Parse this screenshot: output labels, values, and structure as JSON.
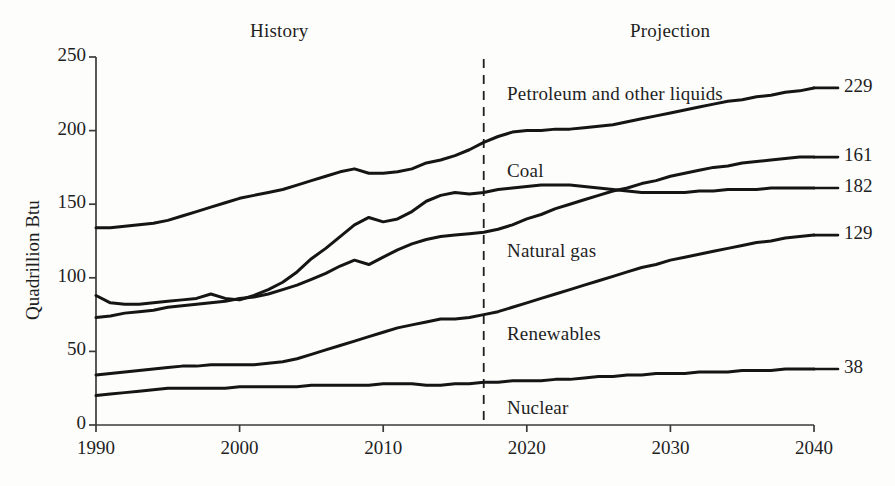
{
  "chart_data": {
    "type": "line",
    "title": "",
    "xlabel": "",
    "ylabel": "Quadrillion Btu",
    "xlim": [
      1990,
      2040
    ],
    "ylim": [
      0,
      250
    ],
    "grid": false,
    "legend_position": "inline-labels",
    "y_ticks": [
      0,
      50,
      100,
      150,
      200,
      250
    ],
    "x_ticks": [
      1990,
      2000,
      2010,
      2020,
      2030,
      2040
    ],
    "annotations": [
      {
        "text": "History",
        "x": 2002,
        "note": "region label left of divider"
      },
      {
        "text": "Projection",
        "x": 2030,
        "note": "region label right of divider"
      }
    ],
    "divider": {
      "x": 2017,
      "style": "dashed",
      "label": "history/projection boundary"
    },
    "x": [
      1990,
      1991,
      1992,
      1993,
      1994,
      1995,
      1996,
      1997,
      1998,
      1999,
      2000,
      2001,
      2002,
      2003,
      2004,
      2005,
      2006,
      2007,
      2008,
      2009,
      2010,
      2011,
      2012,
      2013,
      2014,
      2015,
      2016,
      2017,
      2018,
      2019,
      2020,
      2021,
      2022,
      2023,
      2024,
      2025,
      2026,
      2027,
      2028,
      2029,
      2030,
      2031,
      2032,
      2033,
      2034,
      2035,
      2036,
      2037,
      2038,
      2039,
      2040
    ],
    "series": [
      {
        "name": "Petroleum and other liquids",
        "end_value": 229,
        "values": [
          134,
          134,
          135,
          136,
          137,
          139,
          142,
          145,
          148,
          151,
          154,
          156,
          158,
          160,
          163,
          166,
          169,
          172,
          174,
          171,
          171,
          172,
          174,
          178,
          180,
          183,
          187,
          192,
          196,
          199,
          200,
          200,
          201,
          201,
          202,
          203,
          204,
          206,
          208,
          210,
          212,
          214,
          216,
          218,
          220,
          221,
          223,
          224,
          226,
          227,
          229
        ]
      },
      {
        "name": "Coal",
        "end_value": 161,
        "values": [
          88,
          83,
          82,
          82,
          83,
          84,
          85,
          86,
          89,
          86,
          85,
          88,
          92,
          97,
          104,
          113,
          120,
          128,
          136,
          141,
          138,
          140,
          145,
          152,
          156,
          158,
          157,
          158,
          160,
          161,
          162,
          163,
          163,
          163,
          162,
          161,
          160,
          159,
          158,
          158,
          158,
          158,
          159,
          159,
          160,
          160,
          160,
          161,
          161,
          161,
          161
        ]
      },
      {
        "name": "Natural gas",
        "end_value": 182,
        "values": [
          73,
          74,
          76,
          77,
          78,
          80,
          81,
          82,
          83,
          84,
          86,
          87,
          89,
          92,
          95,
          99,
          103,
          108,
          112,
          109,
          114,
          119,
          123,
          126,
          128,
          129,
          130,
          131,
          133,
          136,
          140,
          143,
          147,
          150,
          153,
          156,
          159,
          161,
          164,
          166,
          169,
          171,
          173,
          175,
          176,
          178,
          179,
          180,
          181,
          182,
          182
        ]
      },
      {
        "name": "Renewables",
        "end_value": 129,
        "values": [
          34,
          35,
          36,
          37,
          38,
          39,
          40,
          40,
          41,
          41,
          41,
          41,
          42,
          43,
          45,
          48,
          51,
          54,
          57,
          60,
          63,
          66,
          68,
          70,
          72,
          72,
          73,
          75,
          77,
          80,
          83,
          86,
          89,
          92,
          95,
          98,
          101,
          104,
          107,
          109,
          112,
          114,
          116,
          118,
          120,
          122,
          124,
          125,
          127,
          128,
          129
        ]
      },
      {
        "name": "Nuclear",
        "end_value": 38,
        "values": [
          20,
          21,
          22,
          23,
          24,
          25,
          25,
          25,
          25,
          25,
          26,
          26,
          26,
          26,
          26,
          27,
          27,
          27,
          27,
          27,
          28,
          28,
          28,
          27,
          27,
          28,
          28,
          29,
          29,
          30,
          30,
          30,
          31,
          31,
          32,
          33,
          33,
          34,
          34,
          35,
          35,
          35,
          36,
          36,
          36,
          37,
          37,
          37,
          38,
          38,
          38
        ]
      }
    ]
  },
  "axes": {
    "y_title": "Quadrillion Btu",
    "y_tick_labels": [
      "250",
      "200",
      "150",
      "100",
      "50",
      "0"
    ],
    "x_tick_labels": [
      "1990",
      "2000",
      "2010",
      "2020",
      "2030",
      "2040"
    ]
  },
  "regions": {
    "history_label": "History",
    "projection_label": "Projection"
  },
  "series_labels": {
    "petroleum": "Petroleum and other liquids",
    "coal": "Coal",
    "natural_gas": "Natural gas",
    "renewables": "Renewables",
    "nuclear": "Nuclear"
  },
  "end_values": {
    "petroleum": "229",
    "coal": "182",
    "natural_gas": "161",
    "renewables": "129",
    "nuclear": "38"
  },
  "colors": {
    "line": "#151515",
    "axis": "#3a3a3a",
    "background": "#fdfdfc",
    "text": "#1f1f1f"
  }
}
